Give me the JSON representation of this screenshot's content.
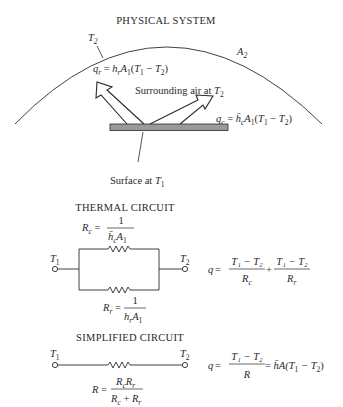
{
  "sections": {
    "physical_system": {
      "title": "PHYSICAL SYSTEM",
      "enclosure_temp_label": "T",
      "enclosure_temp_sub": "2",
      "enclosure_area_label": "A",
      "enclosure_area_sub": "2",
      "radiation_eq": {
        "lhs": "q",
        "lhs_sub": "r",
        "eq": " = ",
        "h": "h",
        "h_sub": "r",
        "A": "A",
        "A_sub": "1",
        "paren_open": "(",
        "T1": "T",
        "T1_sub": "1",
        "minus": " − ",
        "T2": "T",
        "T2_sub": "2",
        "paren_close": ")"
      },
      "air_label": "Surrounding air at ",
      "air_temp": "T",
      "air_temp_sub": "2",
      "convection_eq": {
        "lhs": "q",
        "lhs_sub": "c",
        "eq": " = ",
        "h": "h̄",
        "h_sub": "c",
        "A": "A",
        "A_sub": "1",
        "paren_open": "(",
        "T1": "T",
        "T1_sub": "1",
        "minus": " − ",
        "T2": "T",
        "T2_sub": "2",
        "paren_close": ")"
      },
      "surface_label": "Surface at ",
      "surface_temp": "T",
      "surface_temp_sub": "1",
      "colors": {
        "surface_fill": "#9a9a9a",
        "line": "#2a2a2a"
      }
    },
    "thermal_circuit": {
      "title": "THERMAL CIRCUIT",
      "node_left": "T",
      "node_left_sub": "1",
      "node_right": "T",
      "node_right_sub": "2",
      "Rc": {
        "lhs": "R",
        "lhs_sub": "c",
        "eq": " = ",
        "num": "1",
        "den_h": "h̄",
        "den_h_sub": "c",
        "den_A": "A",
        "den_A_sub": "1"
      },
      "Rr": {
        "lhs": "R",
        "lhs_sub": "r",
        "eq": " = ",
        "num": "1",
        "den_h": "h",
        "den_h_sub": "r",
        "den_A": "A",
        "den_A_sub": "1"
      },
      "q_eq": {
        "lhs": "q",
        "eq": " = ",
        "num1": "T₁ − T₂",
        "den1": "R",
        "den1_sub": "c",
        "plus": "+",
        "num2": "T₁ − T₂",
        "den2": "R",
        "den2_sub": "r"
      }
    },
    "simplified_circuit": {
      "title": "SIMPLIFIED CIRCUIT",
      "node_left": "T",
      "node_left_sub": "1",
      "node_right": "T",
      "node_right_sub": "2",
      "R_eq": {
        "lhs": "R",
        "eq": " = ",
        "num": "RcRr",
        "num_parts": [
          "R",
          "c",
          "R",
          "r"
        ],
        "den": "Rc + Rr",
        "den_parts": [
          "R",
          "c",
          " + ",
          "R",
          "r"
        ]
      },
      "q_eq": {
        "lhs": "q",
        "eq": " = ",
        "num": "T₁ − T₂",
        "den": "R",
        "eq2": " = ",
        "rhs": "h̄A(T",
        "rhs_sub1": "1",
        "rhs_mid": " − T",
        "rhs_sub2": "2",
        "rhs_close": ")"
      }
    }
  }
}
